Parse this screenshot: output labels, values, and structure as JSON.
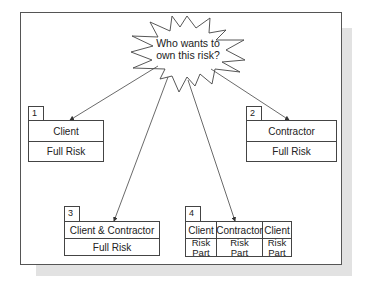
{
  "diagram": {
    "question": "Who wants to own this risk?",
    "question_lines": [
      "Who wants to",
      "own this risk?"
    ],
    "options": [
      {
        "number": "1",
        "owner": "Client",
        "risk": "Full Risk"
      },
      {
        "number": "2",
        "owner": "Contractor",
        "risk": "Full Risk"
      },
      {
        "number": "3",
        "owner": "Client & Contractor",
        "risk": "Full Risk"
      },
      {
        "number": "4",
        "columns": [
          {
            "owner": "Client",
            "risk_lines": [
              "Risk",
              "Part"
            ]
          },
          {
            "owner": "Contractor",
            "risk_lines": [
              "Risk",
              "Part"
            ]
          },
          {
            "owner": "Client",
            "risk_lines": [
              "Risk",
              "Part"
            ]
          }
        ]
      }
    ],
    "colors": {
      "line": "#444444",
      "shadow": "#e2e2e2",
      "background": "#ffffff"
    }
  }
}
